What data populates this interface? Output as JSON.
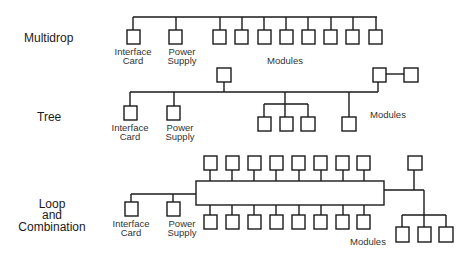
{
  "diagram": {
    "sections": [
      {
        "id": "multidrop",
        "title": "Multidrop",
        "labels": {
          "interface_card_1": "Interface",
          "interface_card_2": "Card",
          "power_supply_1": "Power",
          "power_supply_2": "Supply",
          "modules": "Modules"
        },
        "module_count": 8
      },
      {
        "id": "tree",
        "title": "Tree",
        "labels": {
          "interface_card_1": "Interface",
          "interface_card_2": "Card",
          "power_supply_1": "Power",
          "power_supply_2": "Supply",
          "modules": "Modules"
        },
        "module_count": 7
      },
      {
        "id": "loop",
        "title_lines": [
          "Loop",
          "and",
          "Combination"
        ],
        "labels": {
          "interface_card_1": "Interface",
          "interface_card_2": "Card",
          "power_supply_1": "Power",
          "power_supply_2": "Supply",
          "modules": "Modules"
        },
        "module_count": 20
      }
    ]
  }
}
